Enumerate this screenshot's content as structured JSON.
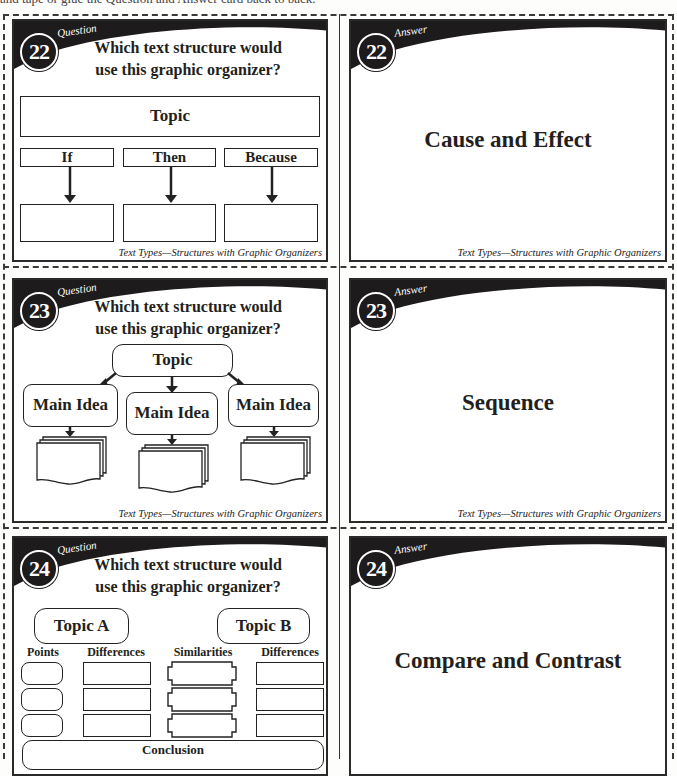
{
  "page": {
    "instruction_partial": "and tape or glue the Question and Answer card back to back."
  },
  "cards": {
    "q22": {
      "number": "22",
      "kind": "Question",
      "title_line1": "Which text structure would",
      "title_line2": "use this graphic organizer?",
      "organizer": {
        "topic": "Topic",
        "columns": [
          "If",
          "Then",
          "Because"
        ]
      },
      "footer": "Text Types—Structures with Graphic Organizers"
    },
    "a22": {
      "number": "22",
      "kind": "Answer",
      "answer": "Cause and Effect",
      "footer": "Text Types—Structures with Graphic Organizers"
    },
    "q23": {
      "number": "23",
      "kind": "Question",
      "title_line1": "Which text structure would",
      "title_line2": "use this graphic organizer?",
      "organizer": {
        "topic": "Topic",
        "main_ideas": [
          "Main Idea",
          "Main Idea",
          "Main Idea"
        ]
      },
      "footer": "Text Types—Structures with Graphic Organizers"
    },
    "a23": {
      "number": "23",
      "kind": "Answer",
      "answer": "Sequence",
      "footer": "Text Types—Structures with Graphic Organizers"
    },
    "q24": {
      "number": "24",
      "kind": "Question",
      "title_line1": "Which text structure would",
      "title_line2": "use this graphic organizer?",
      "organizer": {
        "topic_a": "Topic A",
        "topic_b": "Topic B",
        "headers": [
          "Points",
          "Differences",
          "Similarities",
          "Differences"
        ],
        "conclusion": "Conclusion"
      }
    },
    "a24": {
      "number": "24",
      "kind": "Answer",
      "answer": "Compare and Contrast"
    }
  },
  "colors": {
    "banner": "#1e1b1c",
    "border": "#2a2a2a",
    "page": "#fdfdfc"
  }
}
